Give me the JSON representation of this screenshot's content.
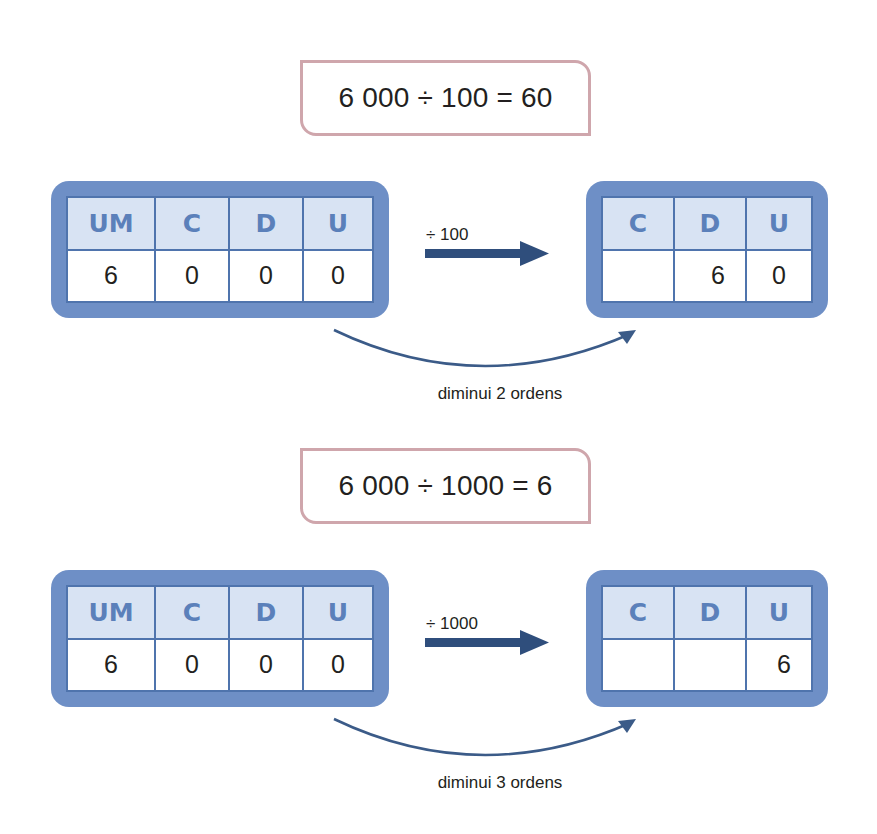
{
  "examples": [
    {
      "equation": "6 000 ÷ 100 = 60",
      "operator_label": "÷ 100",
      "caption": "diminui 2 ordens",
      "before": {
        "headers": [
          "UM",
          "C",
          "D",
          "U"
        ],
        "values": [
          "6",
          "0",
          "0",
          "0"
        ]
      },
      "after": {
        "headers": [
          "C",
          "D",
          "U"
        ],
        "values": [
          "",
          "6",
          "0"
        ]
      }
    },
    {
      "equation": "6 000 ÷ 1000 = 6",
      "operator_label": "÷ 1000",
      "caption": "diminui 3 ordens",
      "before": {
        "headers": [
          "UM",
          "C",
          "D",
          "U"
        ],
        "values": [
          "6",
          "0",
          "0",
          "0"
        ]
      },
      "after": {
        "headers": [
          "C",
          "D",
          "U"
        ],
        "values": [
          "",
          "",
          "6"
        ]
      }
    }
  ],
  "colors": {
    "frame": "#6e8fc6",
    "header_fill": "#d8e3f3",
    "header_text": "#5b80ba",
    "arrow": "#2f4e7c",
    "equation_border": "#cfa6ac"
  },
  "icons": {
    "straight_arrow": "right-arrow-icon",
    "curved_arrow": "curved-arrow-icon"
  }
}
